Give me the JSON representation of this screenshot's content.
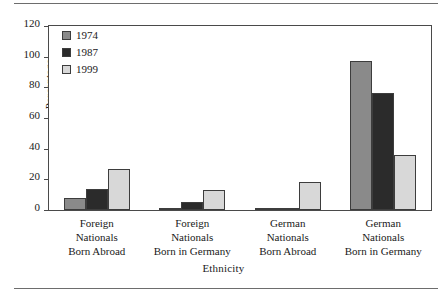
{
  "figure": {
    "has_top_rule": true,
    "has_bottom_rule": true,
    "rule_color": "#6d6d6d",
    "frame_color": "#4a4a4a"
  },
  "chart_data": {
    "type": "bar",
    "title": "",
    "xlabel": "Ethnicity",
    "ylabel": "Percentage",
    "ylim": [
      0,
      120
    ],
    "yticks": [
      0,
      20,
      40,
      60,
      80,
      100,
      120
    ],
    "grid": false,
    "legend_position": "top-left inside plot",
    "categories": [
      "Foreign Nationals Born Abroad",
      "Foreign Nationals Born in Germany",
      "German Nationals Born Abroad",
      "German Nationals Born in Germany"
    ],
    "category_lines": [
      [
        "Foreign",
        "Nationals",
        "Born Abroad"
      ],
      [
        "Foreign",
        "Nationals",
        "Born in Germany"
      ],
      [
        "German",
        "Nationals",
        "Born Abroad"
      ],
      [
        "German",
        "Nationals",
        "Born in Germany"
      ]
    ],
    "series": [
      {
        "name": "1974",
        "color": "#8a8a8a",
        "values": [
          8,
          1,
          1,
          97
        ]
      },
      {
        "name": "1987",
        "color": "#2b2b2b",
        "values": [
          14,
          5,
          1.5,
          76
        ]
      },
      {
        "name": "1999",
        "color": "#d8d8d8",
        "values": [
          27,
          13,
          18,
          36
        ]
      }
    ]
  }
}
